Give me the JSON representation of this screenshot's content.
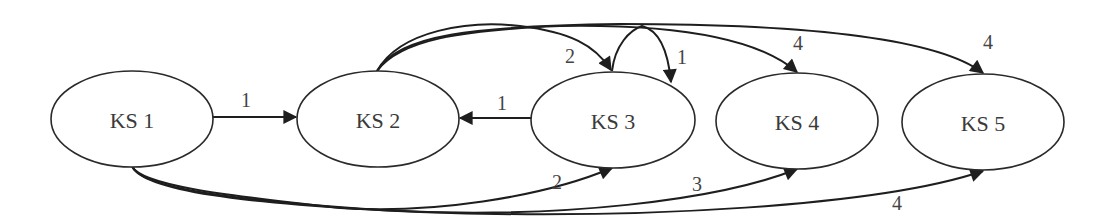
{
  "diagram": {
    "type": "directed-graph",
    "nodes": [
      {
        "id": "ks1",
        "label": "KS 1",
        "cx": 132,
        "cy": 119,
        "rx": 81,
        "ry": 48
      },
      {
        "id": "ks2",
        "label": "KS 2",
        "cx": 378,
        "cy": 119,
        "rx": 81,
        "ry": 48
      },
      {
        "id": "ks3",
        "label": "KS 3",
        "cx": 613,
        "cy": 120,
        "rx": 82,
        "ry": 48
      },
      {
        "id": "ks4",
        "label": "KS 4",
        "cx": 797,
        "cy": 121,
        "rx": 81,
        "ry": 48
      },
      {
        "id": "ks5",
        "label": "KS 5",
        "cx": 983,
        "cy": 122,
        "rx": 81,
        "ry": 48
      }
    ],
    "edges": [
      {
        "from": "KS 1",
        "to": "KS 2",
        "label": "1"
      },
      {
        "from": "KS 3",
        "to": "KS 2",
        "label": "1"
      },
      {
        "from": "KS 2",
        "to": "KS 3",
        "label": "2"
      },
      {
        "from": "KS 3",
        "to": "KS 3",
        "label": "1"
      },
      {
        "from": "KS 2",
        "to": "KS 4",
        "label": "4"
      },
      {
        "from": "KS 2",
        "to": "KS 5",
        "label": "4"
      },
      {
        "from": "KS 1",
        "to": "KS 3",
        "label": "2"
      },
      {
        "from": "KS 1",
        "to": "KS 4",
        "label": "3"
      },
      {
        "from": "KS 1",
        "to": "KS 5",
        "label": "4"
      }
    ],
    "colors": {
      "stroke": "#1e1e1e",
      "text": "#3a3a3a",
      "background": "#ffffff"
    }
  }
}
